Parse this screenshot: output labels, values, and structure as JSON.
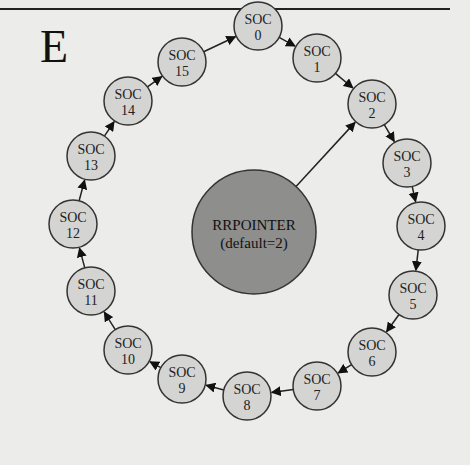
{
  "figure": {
    "panel_label": "E",
    "center": {
      "line1": "RRPOINTER",
      "line2": "(default=2)",
      "points_to": 2
    },
    "node_prefix": "SOC",
    "nodes": [
      {
        "id": 0,
        "label": "SOC",
        "num": "0",
        "x": 258,
        "y": 26
      },
      {
        "id": 1,
        "label": "SOC",
        "num": "1",
        "x": 317,
        "y": 58
      },
      {
        "id": 2,
        "label": "SOC",
        "num": "2",
        "x": 372,
        "y": 104
      },
      {
        "id": 3,
        "label": "SOC",
        "num": "3",
        "x": 407,
        "y": 163
      },
      {
        "id": 4,
        "label": "SOC",
        "num": "4",
        "x": 421,
        "y": 226
      },
      {
        "id": 5,
        "label": "SOC",
        "num": "5",
        "x": 413,
        "y": 295
      },
      {
        "id": 6,
        "label": "SOC",
        "num": "6",
        "x": 372,
        "y": 352
      },
      {
        "id": 7,
        "label": "SOC",
        "num": "7",
        "x": 317,
        "y": 386
      },
      {
        "id": 8,
        "label": "SOC",
        "num": "8",
        "x": 247,
        "y": 396
      },
      {
        "id": 9,
        "label": "SOC",
        "num": "9",
        "x": 182,
        "y": 379
      },
      {
        "id": 10,
        "label": "SOC",
        "num": "10",
        "x": 128,
        "y": 350
      },
      {
        "id": 11,
        "label": "SOC",
        "num": "11",
        "x": 91,
        "y": 291
      },
      {
        "id": 12,
        "label": "SOC",
        "num": "12",
        "x": 73,
        "y": 224
      },
      {
        "id": 13,
        "label": "SOC",
        "num": "13",
        "x": 91,
        "y": 156
      },
      {
        "id": 14,
        "label": "SOC",
        "num": "14",
        "x": 128,
        "y": 101
      },
      {
        "id": 15,
        "label": "SOC",
        "num": "15",
        "x": 182,
        "y": 62
      }
    ],
    "colors": {
      "node_fill": "#d4d4d2",
      "center_fill": "#8e8e8c",
      "stroke": "#222222",
      "background": "#ececea"
    }
  }
}
